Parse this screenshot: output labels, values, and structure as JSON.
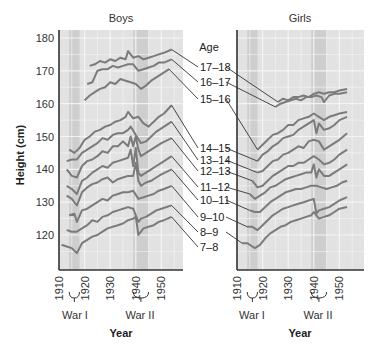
{
  "chart_data": [
    {
      "type": "line",
      "title": "Boys",
      "xlabel": "Year",
      "ylabel": "Height (cm)",
      "xlim": [
        1910,
        1958
      ],
      "ylim": [
        110,
        182
      ],
      "x_ticks": [
        "1910",
        "1920",
        "1930",
        "1940",
        "1950"
      ],
      "y_ticks": [
        "120",
        "130",
        "140",
        "150",
        "160",
        "170",
        "180"
      ],
      "grid": true,
      "shaded_periods": [
        {
          "name": "War I",
          "from": 1914,
          "to": 1918
        },
        {
          "name": "War II",
          "from": 1939,
          "to": 1945
        }
      ],
      "series": [
        {
          "name": "17–18",
          "x": [
            1922,
            1924,
            1926,
            1928,
            1930,
            1932,
            1934,
            1936,
            1937,
            1939,
            1941,
            1943,
            1945,
            1947,
            1949,
            1951,
            1954
          ],
          "values": [
            171.5,
            172,
            173,
            172.5,
            173.5,
            173,
            174,
            173.5,
            176,
            174,
            174.5,
            173.5,
            174,
            174.5,
            175,
            175.5,
            176.5
          ]
        },
        {
          "name": "16–17",
          "x": [
            1921,
            1923,
            1925,
            1927,
            1929,
            1931,
            1933,
            1935,
            1937,
            1939,
            1941,
            1943,
            1945,
            1947,
            1949,
            1951,
            1954
          ],
          "values": [
            166,
            166.5,
            170,
            170.5,
            170.5,
            171.5,
            171,
            171.5,
            172,
            172,
            170,
            170.5,
            171,
            171.5,
            172.5,
            172.5,
            173.5
          ]
        },
        {
          "name": "15–16",
          "x": [
            1920,
            1922,
            1924,
            1926,
            1928,
            1930,
            1932,
            1934,
            1936,
            1938,
            1940,
            1942,
            1944,
            1946,
            1948,
            1950,
            1953
          ],
          "values": [
            161,
            162.5,
            163.5,
            164.5,
            165,
            166.5,
            166,
            167.5,
            167,
            166.5,
            166,
            164.5,
            165.5,
            167,
            168,
            169,
            170.5
          ]
        },
        {
          "name": "14–15",
          "x": [
            1914,
            1916,
            1918,
            1920,
            1922,
            1924,
            1926,
            1928,
            1930,
            1932,
            1934,
            1936,
            1937,
            1939,
            1941,
            1943,
            1945,
            1947,
            1949,
            1951,
            1954
          ],
          "values": [
            146,
            145,
            146.5,
            149,
            150,
            151.5,
            152,
            153,
            153.5,
            154.5,
            155,
            156,
            157.5,
            155.5,
            156,
            154,
            153,
            154.5,
            156,
            157,
            159.5
          ]
        },
        {
          "name": "13–14",
          "x": [
            1913,
            1915,
            1917,
            1919,
            1921,
            1923,
            1925,
            1927,
            1929,
            1931,
            1933,
            1935,
            1937,
            1938,
            1940,
            1942,
            1944,
            1946,
            1948,
            1950,
            1954
          ],
          "values": [
            142.5,
            143,
            143,
            145,
            146,
            147,
            148,
            149.5,
            149,
            150.5,
            151,
            151,
            152,
            153,
            150.5,
            148,
            148.5,
            150,
            151.5,
            152.5,
            154.5
          ]
        },
        {
          "name": "12–13",
          "x": [
            1913,
            1915,
            1917,
            1919,
            1921,
            1923,
            1925,
            1927,
            1929,
            1931,
            1933,
            1935,
            1937,
            1938,
            1939,
            1940,
            1941,
            1942,
            1944,
            1946,
            1948,
            1950,
            1954
          ],
          "values": [
            140,
            138,
            137.5,
            141,
            142.5,
            143,
            144,
            145.5,
            145,
            147,
            147,
            148.5,
            147,
            150,
            147,
            150,
            146,
            144,
            145,
            146,
            147,
            148,
            149.5
          ]
        },
        {
          "name": "11–12",
          "x": [
            1913,
            1915,
            1917,
            1919,
            1921,
            1923,
            1925,
            1927,
            1929,
            1931,
            1933,
            1935,
            1937,
            1938,
            1939,
            1940,
            1941,
            1942,
            1944,
            1946,
            1948,
            1950,
            1954
          ],
          "values": [
            135,
            134,
            132.5,
            136.5,
            137.5,
            139,
            140,
            141,
            140.5,
            142,
            142.5,
            143,
            143.5,
            146,
            141,
            146.5,
            139,
            138,
            139,
            140,
            141,
            142,
            144
          ]
        },
        {
          "name": "10–11",
          "x": [
            1913,
            1915,
            1917,
            1919,
            1921,
            1923,
            1925,
            1927,
            1929,
            1931,
            1933,
            1935,
            1937,
            1939,
            1940,
            1941,
            1942,
            1944,
            1946,
            1948,
            1950,
            1954
          ],
          "values": [
            132,
            131,
            129,
            133,
            134.5,
            135.5,
            136,
            137,
            137.5,
            136,
            137,
            137.5,
            138,
            138,
            142,
            136.5,
            135,
            136,
            136.5,
            137.5,
            138.5,
            140
          ]
        },
        {
          "name": "9–10",
          "x": [
            1914,
            1916,
            1917,
            1919,
            1921,
            1923,
            1925,
            1927,
            1929,
            1931,
            1933,
            1935,
            1937,
            1939,
            1941,
            1943,
            1945,
            1947,
            1949,
            1951,
            1954
          ],
          "values": [
            126,
            126.5,
            124,
            127.5,
            128,
            129,
            130,
            131,
            130.5,
            132,
            132.5,
            133,
            133,
            133.5,
            131,
            131.5,
            132,
            132.5,
            133.5,
            134,
            135
          ]
        },
        {
          "name": "8–9",
          "x": [
            1913,
            1915,
            1917,
            1919,
            1921,
            1923,
            1925,
            1927,
            1929,
            1931,
            1933,
            1935,
            1937,
            1939,
            1941,
            1942,
            1944,
            1946,
            1948,
            1950,
            1954
          ],
          "values": [
            121.5,
            121,
            121,
            122,
            123,
            124.5,
            124,
            125.5,
            126,
            127,
            127.5,
            128,
            128.5,
            128,
            124,
            125,
            125.5,
            126.5,
            127.5,
            128,
            129
          ]
        },
        {
          "name": "7–8",
          "x": [
            1911,
            1913,
            1915,
            1917,
            1919,
            1921,
            1923,
            1925,
            1927,
            1929,
            1931,
            1933,
            1935,
            1937,
            1939,
            1940,
            1941,
            1943,
            1945,
            1947,
            1949,
            1951,
            1954
          ],
          "values": [
            117,
            116.5,
            116,
            114.5,
            117.5,
            118.5,
            119.5,
            120,
            121,
            122,
            122.5,
            123,
            123.5,
            124.5,
            125,
            125.5,
            120,
            122,
            122.5,
            123,
            124,
            124.5,
            125.5
          ]
        }
      ]
    },
    {
      "type": "line",
      "title": "Girls",
      "xlabel": "Year",
      "ylabel": "Height (cm)",
      "xlim": [
        1910,
        1958
      ],
      "ylim": [
        110,
        182
      ],
      "x_ticks": [
        "1910",
        "1920",
        "1930",
        "1940",
        "1950"
      ],
      "grid": true,
      "shaded_periods": [
        {
          "name": "War I",
          "from": 1914,
          "to": 1918
        },
        {
          "name": "War II",
          "from": 1939,
          "to": 1945
        }
      ],
      "series": [
        {
          "name": "16–17",
          "x": [
            1926,
            1928,
            1930,
            1932,
            1934,
            1936,
            1938,
            1940,
            1942,
            1944,
            1946,
            1948,
            1950,
            1953
          ],
          "values": [
            160.5,
            161.5,
            161,
            162,
            162,
            162.5,
            162,
            163,
            163.5,
            163,
            163.5,
            163.5,
            164,
            164.5
          ]
        },
        {
          "name": "15–16",
          "x": [
            1925,
            1927,
            1929,
            1931,
            1933,
            1935,
            1937,
            1939,
            1941,
            1943,
            1944,
            1946,
            1948,
            1950,
            1953
          ],
          "values": [
            159,
            160,
            160.5,
            161,
            161.5,
            161,
            162,
            162,
            162.5,
            162,
            160.5,
            162.5,
            163,
            163,
            163.5
          ]
        },
        {
          "name": "14–15",
          "x": [
            1918,
            1920,
            1922,
            1924,
            1926,
            1928,
            1930,
            1932,
            1934,
            1936,
            1938,
            1940,
            1942,
            1944,
            1946,
            1948,
            1950,
            1953
          ],
          "values": [
            146,
            147.5,
            149,
            150.5,
            151,
            152,
            153.5,
            153.5,
            155,
            155.5,
            156,
            157,
            156,
            155,
            156,
            156.5,
            157,
            157.5
          ]
        },
        {
          "name": "13–14",
          "x": [
            1918,
            1920,
            1922,
            1924,
            1926,
            1928,
            1930,
            1932,
            1934,
            1936,
            1938,
            1940,
            1941,
            1942,
            1944,
            1946,
            1948,
            1950,
            1953
          ],
          "values": [
            142.5,
            144.5,
            145.5,
            147,
            148,
            149.5,
            150,
            150.5,
            152,
            153,
            154,
            155,
            151,
            154,
            152,
            152.5,
            153.5,
            155,
            156
          ]
        },
        {
          "name": "12–13",
          "x": [
            1918,
            1920,
            1922,
            1924,
            1926,
            1928,
            1930,
            1932,
            1934,
            1936,
            1938,
            1940,
            1942,
            1944,
            1946,
            1948,
            1950,
            1953
          ],
          "values": [
            139,
            139.5,
            141,
            142.5,
            143,
            144.5,
            145,
            146,
            147,
            146.5,
            148.5,
            149,
            148.5,
            146,
            147,
            148,
            149,
            151
          ]
        },
        {
          "name": "11–12",
          "x": [
            1916,
            1918,
            1920,
            1922,
            1924,
            1926,
            1928,
            1930,
            1932,
            1934,
            1936,
            1938,
            1940,
            1942,
            1944,
            1946,
            1948,
            1950,
            1953
          ],
          "values": [
            136.5,
            134.5,
            135,
            136.5,
            138,
            139,
            140,
            141,
            141,
            142,
            142,
            143,
            144,
            143,
            141.5,
            142,
            143,
            144.5,
            146
          ]
        },
        {
          "name": "10–11",
          "x": [
            1915,
            1917,
            1919,
            1921,
            1923,
            1925,
            1927,
            1929,
            1931,
            1933,
            1935,
            1937,
            1939,
            1940,
            1941,
            1942,
            1944,
            1946,
            1948,
            1950,
            1953
          ],
          "values": [
            132.5,
            131,
            132,
            133,
            134.5,
            135,
            136,
            137,
            137.5,
            138,
            138.5,
            139,
            139,
            141.5,
            137.5,
            140,
            138,
            138,
            139,
            140,
            141.5
          ]
        },
        {
          "name": "9–10",
          "x": [
            1915,
            1917,
            1919,
            1921,
            1923,
            1925,
            1927,
            1929,
            1931,
            1933,
            1935,
            1937,
            1939,
            1941,
            1943,
            1945,
            1947,
            1949,
            1951,
            1953
          ],
          "values": [
            127.5,
            127,
            127,
            128.5,
            130,
            131,
            132,
            133,
            133.5,
            134,
            134,
            134.5,
            135,
            135,
            134.5,
            134,
            134.5,
            135,
            136,
            136.5
          ]
        },
        {
          "name": "8–9",
          "x": [
            1914,
            1916,
            1918,
            1920,
            1922,
            1924,
            1926,
            1928,
            1930,
            1932,
            1934,
            1936,
            1938,
            1940,
            1941,
            1942,
            1944,
            1946,
            1948,
            1950,
            1953
          ],
          "values": [
            122.5,
            122.5,
            121.5,
            123,
            124.5,
            126,
            127,
            128,
            128.5,
            129,
            129.5,
            130,
            130.5,
            131,
            126.5,
            127.5,
            128,
            128.5,
            129.5,
            130.5,
            131.5
          ]
        },
        {
          "name": "7–8",
          "x": [
            1912,
            1914,
            1916,
            1917,
            1919,
            1921,
            1923,
            1925,
            1927,
            1929,
            1931,
            1933,
            1935,
            1937,
            1939,
            1940,
            1942,
            1944,
            1946,
            1948,
            1950,
            1953
          ],
          "values": [
            117.5,
            117.5,
            116.5,
            116,
            117,
            119,
            120.5,
            121.5,
            122.5,
            123,
            124,
            124.5,
            125,
            125.5,
            126,
            127,
            125,
            125.5,
            126,
            127,
            128,
            128.5
          ]
        }
      ]
    }
  ],
  "labels": {
    "boys_title": "Boys",
    "girls_title": "Girls",
    "age_header": "Age",
    "y_axis_title": "Height (cm)",
    "x_axis_title": "Year",
    "war1": "War I",
    "war2": "War II"
  },
  "age_groups": [
    "17–18",
    "16–17",
    "15–16",
    "14–15",
    "13–14",
    "12–13",
    "11–12",
    "10–11",
    "9–10",
    "8–9",
    "7–8"
  ],
  "colors": {
    "line": "#7b7b7b",
    "plot_bg": "#e2e2e2",
    "war_band": "#cacaca",
    "grid": "#f7f7f7",
    "axis": "#333333",
    "leader": "#333333"
  }
}
